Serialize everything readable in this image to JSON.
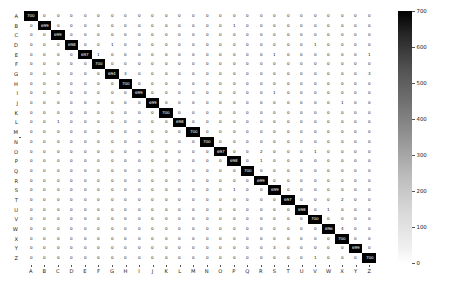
{
  "chart_data": {
    "type": "heatmap",
    "title": "",
    "xlabel": "",
    "ylabel": "",
    "categories_x": [
      "A",
      "B",
      "C",
      "D",
      "E",
      "F",
      "G",
      "H",
      "I",
      "J",
      "K",
      "L",
      "M",
      "N",
      "O",
      "P",
      "Q",
      "R",
      "S",
      "T",
      "U",
      "V",
      "W",
      "X",
      "Y",
      "Z"
    ],
    "categories_y": [
      "A",
      "B",
      "C",
      "D",
      "E",
      "F",
      "G",
      "H",
      "I",
      "J",
      "K",
      "L",
      "M",
      "N",
      "O",
      "P",
      "Q",
      "R",
      "S",
      "T",
      "U",
      "V",
      "W",
      "X",
      "Y",
      "Z"
    ],
    "colorbar": {
      "vmin": 0,
      "vmax": 700,
      "ticks": [
        0,
        100,
        200,
        300,
        400,
        500,
        600,
        700
      ],
      "tick_labels": [
        "0",
        "100",
        "200",
        "300",
        "400",
        "500",
        "600",
        "700"
      ],
      "colormap": "greys",
      "position": "right"
    },
    "grid": false,
    "annotated": true,
    "values": [
      [
        700,
        0,
        0,
        0,
        0,
        0,
        0,
        0,
        0,
        0,
        0,
        0,
        0,
        0,
        0,
        0,
        0,
        0,
        0,
        0,
        0,
        0,
        0,
        0,
        0,
        0
      ],
      [
        0,
        699,
        0,
        0,
        0,
        0,
        0,
        0,
        0,
        0,
        0,
        0,
        0,
        0,
        0,
        1,
        0,
        0,
        0,
        0,
        0,
        0,
        0,
        0,
        0,
        0
      ],
      [
        0,
        0,
        699,
        0,
        0,
        0,
        0,
        0,
        0,
        0,
        0,
        0,
        0,
        0,
        0,
        0,
        0,
        0,
        0,
        0,
        0,
        0,
        0,
        0,
        0,
        0
      ],
      [
        0,
        0,
        0,
        698,
        0,
        0,
        1,
        0,
        0,
        0,
        0,
        0,
        0,
        0,
        0,
        0,
        0,
        0,
        0,
        0,
        0,
        1,
        0,
        0,
        0,
        0
      ],
      [
        0,
        0,
        0,
        0,
        697,
        1,
        0,
        0,
        0,
        0,
        0,
        0,
        0,
        0,
        0,
        0,
        0,
        0,
        1,
        0,
        0,
        0,
        0,
        0,
        0,
        1
      ],
      [
        0,
        0,
        0,
        0,
        0,
        700,
        0,
        0,
        0,
        0,
        0,
        0,
        0,
        0,
        0,
        0,
        0,
        0,
        0,
        0,
        0,
        0,
        0,
        0,
        0,
        0
      ],
      [
        0,
        0,
        0,
        0,
        0,
        0,
        694,
        3,
        0,
        0,
        0,
        0,
        0,
        0,
        0,
        0,
        0,
        0,
        0,
        0,
        0,
        0,
        0,
        0,
        0,
        3
      ],
      [
        0,
        0,
        0,
        0,
        0,
        0,
        0,
        700,
        0,
        0,
        0,
        0,
        0,
        0,
        0,
        0,
        0,
        0,
        0,
        0,
        0,
        0,
        0,
        0,
        0,
        0
      ],
      [
        0,
        0,
        0,
        0,
        0,
        0,
        0,
        0,
        699,
        0,
        0,
        0,
        0,
        0,
        0,
        0,
        0,
        0,
        1,
        0,
        0,
        0,
        0,
        0,
        0,
        0
      ],
      [
        0,
        0,
        0,
        0,
        0,
        0,
        0,
        0,
        0,
        699,
        0,
        0,
        0,
        0,
        0,
        0,
        0,
        0,
        0,
        0,
        0,
        0,
        0,
        1,
        0,
        0
      ],
      [
        0,
        0,
        0,
        0,
        0,
        0,
        0,
        0,
        0,
        0,
        700,
        0,
        0,
        0,
        0,
        0,
        0,
        0,
        0,
        0,
        0,
        0,
        0,
        0,
        0,
        0
      ],
      [
        0,
        0,
        1,
        0,
        0,
        0,
        0,
        0,
        0,
        0,
        0,
        698,
        0,
        0,
        0,
        0,
        0,
        0,
        0,
        0,
        0,
        0,
        0,
        0,
        0,
        0
      ],
      [
        0,
        0,
        0,
        0,
        0,
        0,
        0,
        0,
        0,
        0,
        0,
        0,
        700,
        0,
        0,
        0,
        0,
        0,
        0,
        0,
        0,
        0,
        0,
        0,
        0,
        0
      ],
      [
        0,
        0,
        0,
        0,
        0,
        0,
        0,
        0,
        0,
        0,
        0,
        0,
        0,
        700,
        0,
        0,
        0,
        0,
        0,
        0,
        0,
        0,
        0,
        0,
        0,
        0
      ],
      [
        0,
        0,
        0,
        0,
        0,
        0,
        0,
        0,
        0,
        0,
        0,
        0,
        0,
        0,
        697,
        0,
        0,
        2,
        0,
        0,
        0,
        1,
        0,
        0,
        0,
        0
      ],
      [
        0,
        0,
        0,
        0,
        0,
        0,
        0,
        0,
        0,
        0,
        0,
        0,
        0,
        0,
        0,
        698,
        0,
        1,
        0,
        0,
        0,
        0,
        0,
        0,
        0,
        0
      ],
      [
        0,
        0,
        0,
        0,
        0,
        0,
        0,
        0,
        0,
        0,
        0,
        0,
        0,
        0,
        0,
        0,
        700,
        0,
        0,
        0,
        0,
        0,
        0,
        0,
        0,
        0
      ],
      [
        0,
        0,
        0,
        0,
        0,
        0,
        0,
        0,
        0,
        0,
        0,
        0,
        0,
        0,
        0,
        0,
        0,
        699,
        0,
        0,
        0,
        0,
        0,
        0,
        0,
        0
      ],
      [
        0,
        0,
        0,
        0,
        0,
        0,
        0,
        0,
        0,
        0,
        0,
        0,
        0,
        0,
        0,
        1,
        0,
        0,
        699,
        0,
        0,
        0,
        0,
        0,
        0,
        0
      ],
      [
        0,
        0,
        0,
        0,
        0,
        0,
        0,
        0,
        0,
        0,
        0,
        0,
        0,
        0,
        0,
        0,
        0,
        0,
        0,
        697,
        0,
        0,
        0,
        2,
        0,
        0
      ],
      [
        0,
        0,
        0,
        0,
        0,
        0,
        0,
        0,
        0,
        0,
        0,
        0,
        0,
        0,
        0,
        0,
        0,
        0,
        0,
        0,
        698,
        0,
        1,
        0,
        0,
        0
      ],
      [
        0,
        0,
        0,
        0,
        0,
        0,
        0,
        0,
        0,
        0,
        0,
        0,
        0,
        0,
        0,
        0,
        0,
        0,
        0,
        0,
        0,
        700,
        0,
        0,
        0,
        0
      ],
      [
        0,
        0,
        0,
        0,
        0,
        0,
        0,
        0,
        0,
        0,
        0,
        0,
        0,
        0,
        0,
        0,
        0,
        0,
        0,
        0,
        0,
        0,
        696,
        4,
        0,
        0
      ],
      [
        0,
        0,
        0,
        0,
        0,
        0,
        0,
        0,
        0,
        0,
        0,
        0,
        0,
        0,
        0,
        0,
        0,
        0,
        0,
        0,
        0,
        0,
        0,
        700,
        0,
        0
      ],
      [
        0,
        0,
        0,
        0,
        0,
        0,
        0,
        0,
        0,
        0,
        0,
        0,
        0,
        0,
        0,
        0,
        0,
        0,
        3,
        0,
        0,
        0,
        0,
        0,
        699,
        0
      ],
      [
        0,
        0,
        0,
        0,
        0,
        0,
        0,
        0,
        0,
        0,
        0,
        0,
        0,
        0,
        0,
        0,
        0,
        0,
        0,
        0,
        0,
        1,
        0,
        0,
        0,
        700
      ]
    ]
  }
}
